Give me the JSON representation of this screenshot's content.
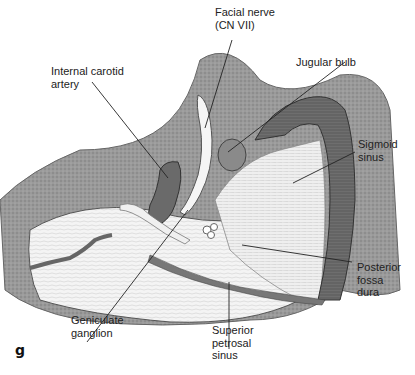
{
  "figure": {
    "panel_label": "g",
    "labels": {
      "facial_nerve": "Facial nerve\n(CN VII)",
      "jugular_bulb": "Jugular bulb",
      "internal_carotid": "Internal carotid\nartery",
      "sigmoid_sinus": "Sigmoid\nsinus",
      "posterior_fossa_dura": "Posterior\nfossa\ndura",
      "geniculate_ganglion": "Geniculate\nganglion",
      "superior_petrosal_sinus": "Superior\npetrosal\nsinus"
    }
  }
}
